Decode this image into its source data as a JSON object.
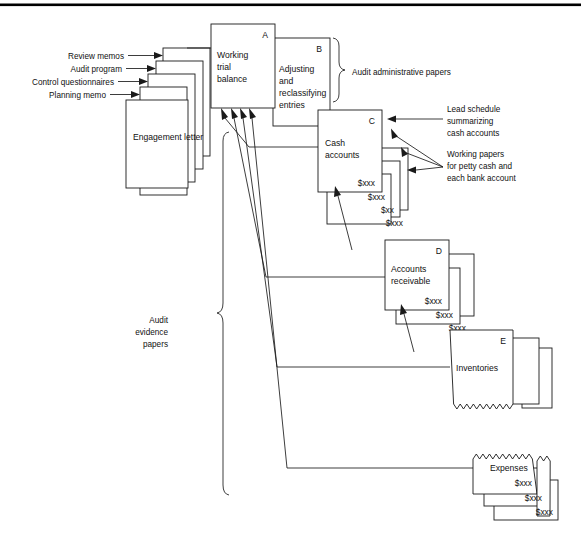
{
  "figure": {
    "type": "audit-working-papers-flow-diagram",
    "top_rule": true
  },
  "inputs": {
    "labels": [
      "Review memos",
      "Audit program",
      "Control questionnaires",
      "Planning memo"
    ],
    "base_document": "Engagement letter"
  },
  "boxes": {
    "a": {
      "id": "A",
      "title_lines": [
        "Working",
        "trial",
        "balance"
      ]
    },
    "b": {
      "id": "B",
      "title_lines": [
        "Adjusting",
        "and",
        "reclassifying",
        "entries"
      ]
    },
    "c": {
      "id": "C",
      "title_lines": [
        "Cash",
        "accounts"
      ],
      "amount": "$xxx",
      "stack_amounts": [
        "$xxx",
        "$xx",
        "$xxx"
      ]
    },
    "d": {
      "id": "D",
      "title_lines": [
        "Accounts",
        "receivable"
      ],
      "amount": "$xxx",
      "stack_amounts": [
        "$xxx",
        "$xxx"
      ]
    },
    "e": {
      "id": "E",
      "title_lines": [
        "Inventories"
      ]
    },
    "f": {
      "title_lines": [
        "Expenses"
      ],
      "amount": "$xxx",
      "stack_amounts": [
        "$xxx",
        "$xxx"
      ]
    }
  },
  "annotations": {
    "admin_papers": "Audit administrative papers",
    "lead_schedule": [
      "Lead schedule",
      "summarizing",
      "cash accounts"
    ],
    "working_papers": [
      "Working papers",
      "for petty cash and",
      "each bank account"
    ],
    "evidence_papers": [
      "Audit",
      "evidence",
      "papers"
    ]
  },
  "colors": {
    "ink": "#1a1a1a",
    "paper": "#ffffff",
    "background": "#ffffff"
  }
}
